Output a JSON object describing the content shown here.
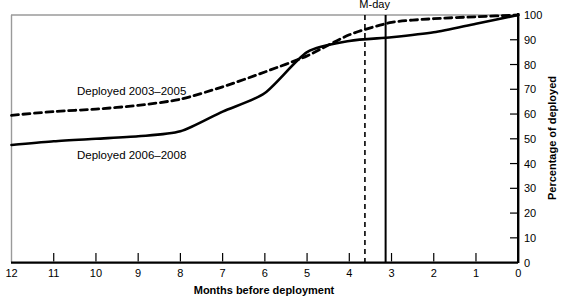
{
  "chart_data": {
    "type": "line",
    "title": "",
    "subtitle": "",
    "xlabel": "Months before deployment",
    "ylabel": "Percentage of deployed",
    "xlim": [
      12,
      0
    ],
    "ylim": [
      0,
      100
    ],
    "x_tick_labels": [
      "12",
      "11",
      "10",
      "9",
      "8",
      "7",
      "6",
      "5",
      "4",
      "3",
      "2",
      "1",
      "0"
    ],
    "x_ticks": [
      12,
      11,
      10,
      9,
      8,
      7,
      6,
      5,
      4,
      3,
      2,
      1,
      0
    ],
    "y_tick_labels": [
      "0",
      "10",
      "20",
      "30",
      "40",
      "50",
      "60",
      "70",
      "80",
      "90",
      "100"
    ],
    "y_ticks": [
      0,
      10,
      20,
      30,
      40,
      50,
      60,
      70,
      80,
      90,
      100
    ],
    "grid": false,
    "legend_position": "inline-labels",
    "y_axis_side": "right",
    "x": [
      12,
      11,
      10,
      9,
      8,
      7,
      6,
      5,
      4,
      3,
      2,
      1,
      0
    ],
    "series": [
      {
        "name": "Deployed 2003–2005",
        "style": "dashed",
        "color": "#000000",
        "label_x": 10.45,
        "label_y": 67.5,
        "values": [
          59.5,
          61.0,
          62.0,
          63.5,
          66.0,
          71.0,
          77.0,
          83.5,
          92.0,
          97.0,
          98.5,
          99.3,
          100.0
        ]
      },
      {
        "name": "Deployed 2006–2008",
        "style": "solid",
        "color": "#000000",
        "label_x": 10.45,
        "label_y": 42.0,
        "values": [
          47.5,
          49.0,
          50.0,
          51.0,
          53.0,
          61.0,
          68.5,
          85.0,
          89.5,
          91.0,
          93.0,
          96.5,
          100.0
        ]
      }
    ],
    "annotations": [
      {
        "name": "m-day-label",
        "text": "M-day",
        "x": 3.4,
        "y": 103
      },
      {
        "name": "m-day-line-dashed",
        "text": "",
        "x": 3.63,
        "style": "dashed",
        "y_from": 0,
        "y_to": 100
      },
      {
        "name": "m-day-line-solid",
        "text": "",
        "x": 3.14,
        "style": "solid",
        "y_from": 0,
        "y_to": 100
      }
    ],
    "colors": {
      "line": "#000000",
      "axis": "#000000",
      "frame_light": "#9a9a9a",
      "background": "#ffffff"
    }
  }
}
